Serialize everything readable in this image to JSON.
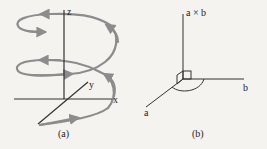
{
  "figure": {
    "panel_a": {
      "caption": "(a)",
      "axes": {
        "x_label": "x",
        "y_label": "y",
        "z_label": "z"
      },
      "curve": {
        "type": "helix",
        "turns": 2,
        "color": "#8c8c8c",
        "arrow_direction": "counterclockwise-upward"
      }
    },
    "panel_b": {
      "caption": "(b)",
      "vectors": {
        "a_label": "a",
        "b_label": "b",
        "cross_label": "a × b"
      },
      "right_angle_marker": true,
      "angle_arc": true
    },
    "colors": {
      "background": "#f4f3f0",
      "axis": "#333333",
      "helix": "#8c8c8c",
      "text": "#222222"
    }
  }
}
